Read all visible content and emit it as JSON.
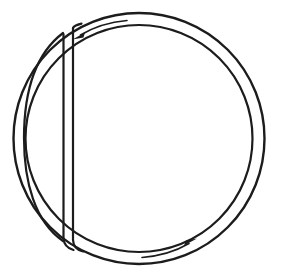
{
  "figure": {
    "background_color": "#ffffff",
    "stroke_color": "#1c1c1c",
    "line_width": 2.2,
    "caption": ""
  },
  "geometry": {
    "canvas": {
      "width": 283,
      "height": 278
    },
    "outer_circle": {
      "name": "outer-circle",
      "center_x": 139,
      "center_y": 138.5,
      "radius": 125.5
    },
    "inner_circle": {
      "name": "inner-circle",
      "center_x": 139,
      "center_y": 138.5,
      "radius": 113.5
    },
    "chord_left_line": {
      "name": "chord-left-edge",
      "x": 63,
      "y_top": 31,
      "y_bottom": 243
    },
    "chord_right_line": {
      "name": "chord-right-edge",
      "x": 73,
      "y_top": 27,
      "y_bottom": 247
    },
    "left_lune_arc": {
      "name": "left-lune-arc",
      "description": "inner arc bounding the narrow left crescent",
      "top_x": 63,
      "top_y": 33,
      "bottom_x": 63,
      "bottom_y": 241,
      "bulge_x": 26
    }
  },
  "arrows": [
    {
      "name": "top-flow-arrow",
      "label": "",
      "direction": "counterclockwise",
      "points_toward": "left",
      "position": "top-left inner arc",
      "tail_x": 126,
      "tail_y": 21,
      "tip_x": 73,
      "tip_y": 37
    },
    {
      "name": "bottom-flow-arrow",
      "label": "",
      "direction": "counterclockwise",
      "points_toward": "right",
      "position": "bottom-right inner arc",
      "tail_x": 143,
      "tail_y": 257,
      "tip_x": 192,
      "tip_y": 241
    }
  ],
  "labels": {
    "none_visible": ""
  }
}
